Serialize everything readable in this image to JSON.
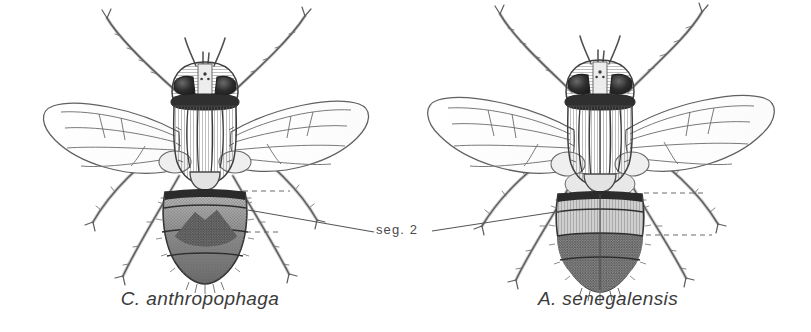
{
  "figure": {
    "background_color": "#ffffff",
    "ink_color": "#3b3b3b",
    "line_color": "#555555",
    "dark_fill": "#4a4a4a",
    "mid_fill": "#8a8a8a",
    "light_fill": "#d8d8d8",
    "type": "scientific-line-drawing"
  },
  "annotation": {
    "label": "seg. 2",
    "description": "leader lines from abdominal segment 2 of both specimens"
  },
  "specimens": [
    {
      "id": "left",
      "caption": "C. anthropophaga",
      "abdomen_pattern": "dark triangular chevron patch"
    },
    {
      "id": "right",
      "caption": "A. senegalensis",
      "abdomen_pattern": "transverse bands with dark posterior"
    }
  ]
}
